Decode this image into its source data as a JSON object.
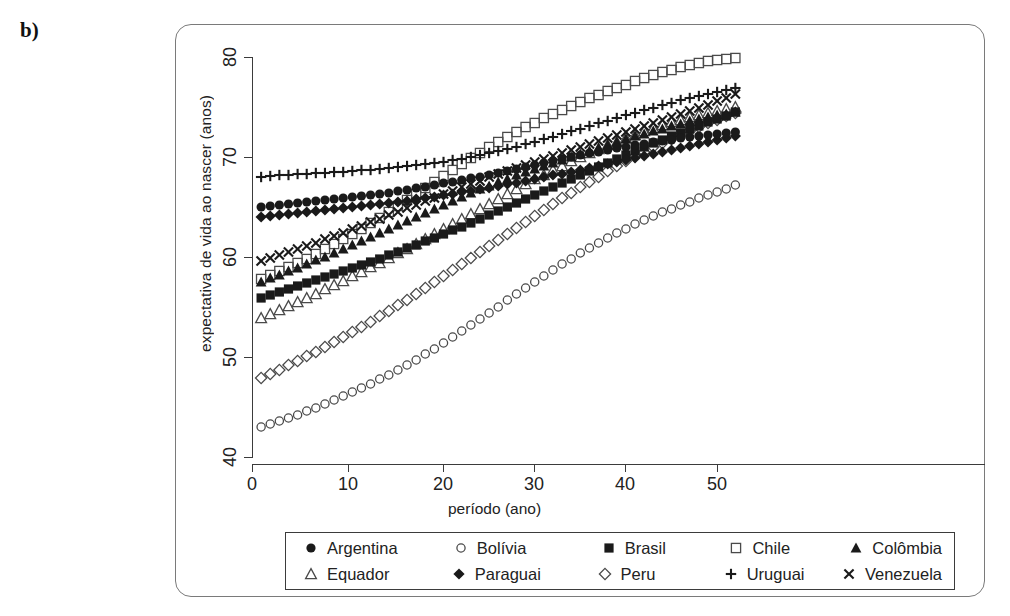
{
  "panel": {
    "label": "b)"
  },
  "axes": {
    "x_title": "período (ano)",
    "y_title": "expectativa de vida ao nascer (anos)",
    "x_ticks": [
      "0",
      "10",
      "20",
      "30",
      "40",
      "50"
    ],
    "y_ticks": [
      "80",
      "70",
      "60",
      "50",
      "40"
    ]
  },
  "legend": {
    "row1": [
      {
        "label": "Argentina",
        "marker": "filled-circle-icon"
      },
      {
        "label": "Bolívia",
        "marker": "open-circle-icon"
      },
      {
        "label": "Brasil",
        "marker": "filled-square-icon"
      },
      {
        "label": "Chile",
        "marker": "open-square-icon"
      },
      {
        "label": "Colômbia",
        "marker": "filled-triangle-icon"
      }
    ],
    "row2": [
      {
        "label": "Equador",
        "marker": "open-triangle-icon"
      },
      {
        "label": "Paraguai",
        "marker": "filled-diamond-icon"
      },
      {
        "label": "Peru",
        "marker": "open-diamond-icon"
      },
      {
        "label": "Uruguai",
        "marker": "plus-icon"
      },
      {
        "label": "Venezuela",
        "marker": "cross-icon"
      }
    ]
  },
  "chart_data": {
    "type": "scatter",
    "title": "",
    "xlabel": "período (ano)",
    "ylabel": "expectativa de vida ao nascer (anos)",
    "xlim": [
      0,
      54
    ],
    "ylim": [
      40,
      81
    ],
    "xticks": [
      0,
      10,
      20,
      30,
      40,
      50
    ],
    "yticks": [
      40,
      50,
      60,
      70,
      80
    ],
    "grid": false,
    "legend_position": "below-axes",
    "marker_color": "#1a1a1a",
    "x": [
      1,
      2,
      3,
      4,
      5,
      6,
      7,
      8,
      9,
      10,
      11,
      12,
      13,
      14,
      15,
      16,
      17,
      18,
      19,
      20,
      21,
      22,
      23,
      24,
      25,
      26,
      27,
      28,
      29,
      30,
      31,
      32,
      33,
      34,
      35,
      36,
      37,
      38,
      39,
      40,
      41,
      42,
      43,
      44,
      45,
      46,
      47,
      48,
      49,
      50,
      51,
      52,
      53
    ],
    "series": [
      {
        "name": "Argentina",
        "marker": "filled-circle",
        "values": [
          65.0,
          65.1,
          65.2,
          65.3,
          65.4,
          65.5,
          65.6,
          65.7,
          65.8,
          65.9,
          66.0,
          66.1,
          66.2,
          66.3,
          66.4,
          66.6,
          66.7,
          66.9,
          67.0,
          67.2,
          67.4,
          67.5,
          67.7,
          67.9,
          68.0,
          68.2,
          68.4,
          68.6,
          68.8,
          69.0,
          69.2,
          69.4,
          69.6,
          69.8,
          70.0,
          70.2,
          70.4,
          70.5,
          70.7,
          70.9,
          71.0,
          71.2,
          71.3,
          71.5,
          71.6,
          71.7,
          71.9,
          72.0,
          72.1,
          72.2,
          72.3,
          72.4,
          72.5
        ]
      },
      {
        "name": "Bolívia",
        "marker": "open-circle",
        "values": [
          43.0,
          43.3,
          43.6,
          43.9,
          44.2,
          44.6,
          44.9,
          45.3,
          45.7,
          46.1,
          46.5,
          46.9,
          47.3,
          47.8,
          48.2,
          48.7,
          49.2,
          49.7,
          50.3,
          50.8,
          51.4,
          52.0,
          52.6,
          53.2,
          53.8,
          54.4,
          55.0,
          55.7,
          56.3,
          56.9,
          57.5,
          58.1,
          58.7,
          59.3,
          59.8,
          60.4,
          60.9,
          61.4,
          61.9,
          62.4,
          62.8,
          63.3,
          63.7,
          64.1,
          64.5,
          64.8,
          65.2,
          65.5,
          65.9,
          66.2,
          66.5,
          66.8,
          67.2
        ]
      },
      {
        "name": "Brasil",
        "marker": "filled-square",
        "values": [
          55.9,
          56.2,
          56.5,
          56.8,
          57.1,
          57.4,
          57.7,
          58.0,
          58.3,
          58.6,
          58.9,
          59.2,
          59.5,
          59.8,
          60.2,
          60.5,
          60.9,
          61.2,
          61.6,
          61.9,
          62.3,
          62.7,
          63.0,
          63.4,
          63.8,
          64.2,
          64.6,
          65.0,
          65.4,
          65.8,
          66.2,
          66.6,
          67.0,
          67.4,
          67.8,
          68.2,
          68.6,
          69.0,
          69.4,
          69.8,
          70.2,
          70.6,
          71.0,
          71.4,
          71.7,
          72.1,
          72.4,
          72.8,
          73.1,
          73.5,
          73.8,
          74.1,
          74.5
        ]
      },
      {
        "name": "Chile",
        "marker": "open-square",
        "values": [
          57.8,
          58.2,
          58.6,
          59.0,
          59.4,
          59.8,
          60.3,
          60.8,
          61.3,
          61.8,
          62.3,
          62.8,
          63.4,
          63.9,
          64.5,
          65.1,
          65.7,
          66.3,
          66.9,
          67.5,
          68.1,
          68.7,
          69.3,
          69.9,
          70.4,
          71.0,
          71.5,
          72.0,
          72.5,
          73.0,
          73.4,
          73.9,
          74.3,
          74.7,
          75.1,
          75.5,
          75.9,
          76.2,
          76.6,
          76.9,
          77.2,
          77.6,
          77.9,
          78.2,
          78.5,
          78.7,
          79.0,
          79.2,
          79.4,
          79.6,
          79.7,
          79.8,
          79.9
        ]
      },
      {
        "name": "Colômbia",
        "marker": "filled-triangle",
        "values": [
          57.5,
          57.9,
          58.2,
          58.6,
          58.9,
          59.3,
          59.7,
          60.0,
          60.4,
          60.8,
          61.2,
          61.6,
          62.0,
          62.4,
          62.8,
          63.2,
          63.6,
          64.0,
          64.4,
          64.8,
          65.2,
          65.6,
          66.0,
          66.4,
          66.8,
          67.1,
          67.5,
          67.8,
          68.2,
          68.5,
          68.8,
          69.1,
          69.4,
          69.7,
          70.0,
          70.3,
          70.6,
          70.9,
          71.2,
          71.5,
          71.8,
          72.1,
          72.3,
          72.6,
          72.8,
          73.1,
          73.3,
          73.6,
          73.8,
          74.0,
          74.2,
          74.3,
          74.5
        ]
      },
      {
        "name": "Equador",
        "marker": "open-triangle",
        "values": [
          53.9,
          54.3,
          54.7,
          55.1,
          55.5,
          55.9,
          56.3,
          56.8,
          57.2,
          57.6,
          58.1,
          58.5,
          59.0,
          59.4,
          59.9,
          60.4,
          60.8,
          61.3,
          61.8,
          62.3,
          62.8,
          63.3,
          63.8,
          64.3,
          64.8,
          65.3,
          65.8,
          66.3,
          66.8,
          67.3,
          67.8,
          68.2,
          68.7,
          69.1,
          69.6,
          70.0,
          70.4,
          70.8,
          71.2,
          71.5,
          71.9,
          72.2,
          72.6,
          72.9,
          73.2,
          73.5,
          73.7,
          74.0,
          74.2,
          74.4,
          74.6,
          74.8,
          75.0
        ]
      },
      {
        "name": "Paraguai",
        "marker": "filled-diamond",
        "values": [
          64.0,
          64.1,
          64.2,
          64.3,
          64.4,
          64.5,
          64.6,
          64.7,
          64.8,
          64.9,
          65.0,
          65.1,
          65.2,
          65.3,
          65.4,
          65.5,
          65.6,
          65.8,
          65.9,
          66.0,
          66.2,
          66.3,
          66.5,
          66.6,
          66.8,
          66.9,
          67.1,
          67.3,
          67.4,
          67.6,
          67.8,
          68.0,
          68.2,
          68.3,
          68.5,
          68.7,
          68.9,
          69.1,
          69.3,
          69.5,
          69.7,
          69.9,
          70.1,
          70.3,
          70.5,
          70.7,
          70.9,
          71.1,
          71.3,
          71.5,
          71.7,
          71.9,
          72.1
        ]
      },
      {
        "name": "Peru",
        "marker": "open-diamond",
        "values": [
          47.9,
          48.3,
          48.7,
          49.2,
          49.6,
          50.1,
          50.5,
          51.0,
          51.5,
          52.0,
          52.5,
          53.0,
          53.5,
          54.1,
          54.6,
          55.2,
          55.7,
          56.3,
          56.9,
          57.5,
          58.1,
          58.7,
          59.3,
          59.9,
          60.5,
          61.1,
          61.7,
          62.3,
          62.9,
          63.5,
          64.1,
          64.7,
          65.3,
          65.9,
          66.4,
          67.0,
          67.5,
          68.0,
          68.6,
          69.1,
          69.6,
          70.1,
          70.5,
          71.0,
          71.4,
          71.8,
          72.2,
          72.6,
          73.0,
          73.4,
          73.7,
          74.1,
          74.4
        ]
      },
      {
        "name": "Uruguai",
        "marker": "plus",
        "values": [
          68.0,
          68.1,
          68.2,
          68.2,
          68.3,
          68.3,
          68.4,
          68.4,
          68.5,
          68.5,
          68.6,
          68.7,
          68.7,
          68.8,
          68.9,
          69.0,
          69.1,
          69.2,
          69.3,
          69.4,
          69.5,
          69.7,
          69.8,
          70.0,
          70.2,
          70.4,
          70.6,
          70.8,
          71.0,
          71.3,
          71.5,
          71.8,
          72.0,
          72.3,
          72.6,
          72.8,
          73.1,
          73.4,
          73.6,
          73.9,
          74.2,
          74.4,
          74.7,
          74.9,
          75.2,
          75.4,
          75.7,
          75.9,
          76.1,
          76.3,
          76.5,
          76.7,
          76.9
        ]
      },
      {
        "name": "Venezuela",
        "marker": "cross",
        "values": [
          59.6,
          59.9,
          60.2,
          60.5,
          60.8,
          61.1,
          61.4,
          61.8,
          62.1,
          62.4,
          62.8,
          63.1,
          63.5,
          63.8,
          64.2,
          64.5,
          64.9,
          65.2,
          65.6,
          65.9,
          66.3,
          66.6,
          67.0,
          67.3,
          67.6,
          68.0,
          68.3,
          68.6,
          68.9,
          69.2,
          69.5,
          69.8,
          70.1,
          70.4,
          70.7,
          71.0,
          71.3,
          71.6,
          71.9,
          72.2,
          72.5,
          72.8,
          73.1,
          73.4,
          73.7,
          74.0,
          74.3,
          74.6,
          74.9,
          75.2,
          75.6,
          75.9,
          76.3
        ]
      }
    ]
  }
}
